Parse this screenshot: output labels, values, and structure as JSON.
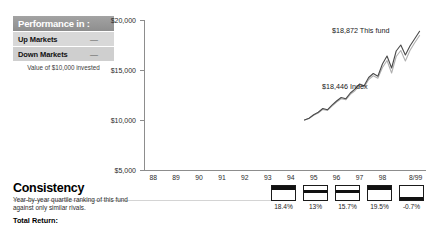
{
  "performance_panel": {
    "header": "Performance in :",
    "rows": [
      {
        "label": "Up Markets",
        "value": "—"
      },
      {
        "label": "Down Markets",
        "value": "—"
      }
    ],
    "caption": "Value of $10,000 invested"
  },
  "consistency": {
    "title": "Consistency",
    "description": "Year-by-year quartile ranking of this fund against only similar rivals.",
    "total_return_label": "Total Return:"
  },
  "chart_data": {
    "type": "line",
    "title": "",
    "xlabel": "",
    "ylabel": "",
    "ylim": [
      5000,
      20000
    ],
    "grid": false,
    "legend_position": "inline-annotation",
    "y_ticks": [
      "$5,000",
      "$10,000",
      "$15,000",
      "$20,000"
    ],
    "y_tick_values": [
      5000,
      10000,
      15000,
      20000
    ],
    "x_ticks": [
      "88",
      "89",
      "90",
      "91",
      "92",
      "93",
      "94",
      "95",
      "96",
      "97",
      "98",
      "8/99"
    ],
    "annotations": [
      {
        "text": "$18,872 This fund",
        "value": 18872,
        "series": "This fund"
      },
      {
        "text": "$18,446 Index",
        "value": 18446,
        "series": "Index"
      }
    ],
    "series": [
      {
        "name": "This fund",
        "color": "#4a4a4a",
        "x": [
          94.6,
          94.8,
          95.0,
          95.2,
          95.4,
          95.6,
          95.8,
          96.0,
          96.2,
          96.4,
          96.6,
          96.8,
          97.0,
          97.2,
          97.4,
          97.6,
          97.8,
          98.0,
          98.2,
          98.4,
          98.6,
          98.8,
          99.0,
          99.2,
          99.4,
          99.62
        ],
        "values": [
          10000,
          10180,
          10520,
          10780,
          11150,
          11020,
          11480,
          11900,
          12250,
          12120,
          12700,
          13080,
          13600,
          13420,
          14250,
          14650,
          14380,
          15600,
          16400,
          15200,
          16900,
          17500,
          16500,
          17400,
          18100,
          18872
        ]
      },
      {
        "name": "Index",
        "color": "#b0b0b0",
        "x": [
          94.6,
          94.8,
          95.0,
          95.2,
          95.4,
          95.6,
          95.8,
          96.0,
          96.2,
          96.4,
          96.6,
          96.8,
          97.0,
          97.2,
          97.4,
          97.6,
          97.8,
          98.0,
          98.2,
          98.4,
          98.6,
          98.8,
          99.0,
          99.2,
          99.4,
          99.62
        ],
        "values": [
          10000,
          10160,
          10470,
          10700,
          11060,
          10960,
          11390,
          11800,
          12120,
          12020,
          12560,
          12930,
          13420,
          13280,
          14050,
          14420,
          14180,
          15250,
          15950,
          14700,
          16350,
          16950,
          15900,
          16950,
          17700,
          18446
        ]
      }
    ]
  },
  "quartile_rankings": {
    "years": [
      "95",
      "96",
      "97",
      "98",
      "8/99"
    ],
    "quartiles": [
      1,
      2,
      2,
      1,
      4
    ],
    "returns": [
      "18.4%",
      "13%",
      "15.7%",
      "19.5%",
      "-0.7%"
    ]
  }
}
